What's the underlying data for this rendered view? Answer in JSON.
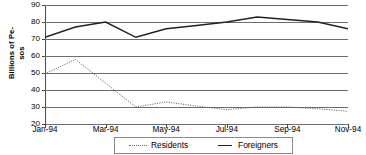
{
  "chart_data": {
    "type": "line",
    "title": "",
    "subtitle": "",
    "xlabel": "",
    "ylabel": "Billions of Pe-sos",
    "ylabel_lines": [
      "Billions of Pe-",
      "sos"
    ],
    "ylim": [
      20,
      90
    ],
    "yticks": [
      20,
      30,
      40,
      50,
      60,
      70,
      80,
      90
    ],
    "ytick_labels": [
      "20",
      "30",
      "40",
      "50",
      "60",
      "70",
      "80",
      "90"
    ],
    "grid": true,
    "legend_position": "bottom",
    "x": [
      "Jan-94",
      "Feb-94",
      "Mar-94",
      "Apr-94",
      "May-94",
      "Jun-94",
      "Jul-94",
      "Aug-94",
      "Sep-94",
      "Oct-94",
      "Nov-94"
    ],
    "xtick_labels": [
      "Jan-94",
      "Mar-94",
      "May-94",
      "Jul-94",
      "Sep-94",
      "Nov-94"
    ],
    "xtick_indices": [
      0,
      2,
      4,
      6,
      8,
      10
    ],
    "series": [
      {
        "name": "Residents",
        "style": "dotted",
        "color": "#555555",
        "values": [
          49.5,
          58.0,
          44.0,
          30.0,
          33.0,
          30.5,
          28.5,
          30.0,
          30.0,
          29.0,
          27.5
        ]
      },
      {
        "name": "Foreigners",
        "style": "solid",
        "color": "#222222",
        "values": [
          71.0,
          77.0,
          80.0,
          71.0,
          76.0,
          78.0,
          80.0,
          83.0,
          81.5,
          80.0,
          76.0
        ]
      }
    ]
  },
  "legend": {
    "items": [
      {
        "label": "Residents",
        "style": "dotted"
      },
      {
        "label": "Foreigners",
        "style": "solid"
      }
    ]
  }
}
